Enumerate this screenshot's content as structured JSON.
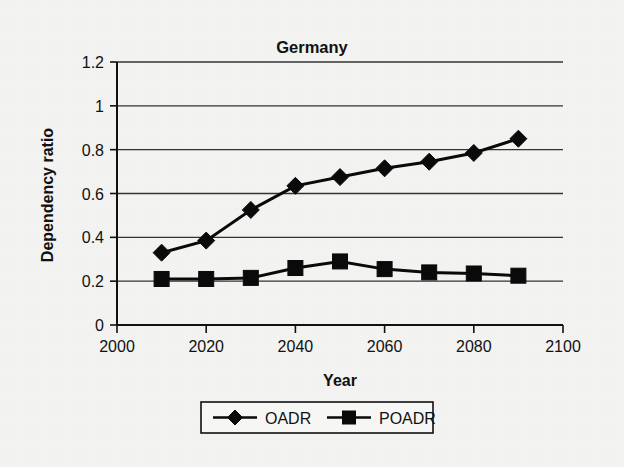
{
  "chart_data": {
    "type": "line",
    "title": "Germany",
    "xlabel": "Year",
    "ylabel": "Dependency ratio",
    "x": [
      2010,
      2020,
      2030,
      2040,
      2050,
      2060,
      2070,
      2080,
      2090
    ],
    "xlim": [
      2000,
      2100
    ],
    "ylim": [
      0,
      1.2
    ],
    "xticks": [
      2000,
      2020,
      2040,
      2060,
      2080,
      2100
    ],
    "xtick_labels": [
      "2000",
      "2020",
      "2040",
      "2060",
      "2080",
      "2100"
    ],
    "yticks": [
      0,
      0.2,
      0.4,
      0.6,
      0.8,
      1,
      1.2
    ],
    "ytick_labels": [
      "0",
      "0.2",
      "0.4",
      "0.6",
      "0.8",
      "1",
      "1.2"
    ],
    "grid": "horizontal",
    "legend_position": "bottom",
    "series": [
      {
        "name": "OADR",
        "marker": "diamond",
        "color": "#0a0a0a",
        "values": [
          0.33,
          0.385,
          0.525,
          0.635,
          0.675,
          0.715,
          0.745,
          0.785,
          0.85
        ]
      },
      {
        "name": "POADR",
        "marker": "square",
        "color": "#0a0a0a",
        "values": [
          0.21,
          0.21,
          0.215,
          0.26,
          0.29,
          0.255,
          0.24,
          0.235,
          0.225
        ]
      }
    ]
  },
  "figure": {
    "background_color": "#f3f3f1",
    "axis_color": "#111111",
    "grid_color": "#333333"
  }
}
